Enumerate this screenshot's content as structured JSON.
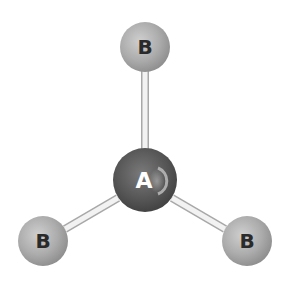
{
  "diagram": {
    "type": "molecular-geometry",
    "shape": "trigonal-planar",
    "central_atom": {
      "label": "A",
      "x": 145,
      "y": 180,
      "r": 32
    },
    "outer_atoms": [
      {
        "label": "B",
        "x": 145,
        "y": 47,
        "r": 25
      },
      {
        "label": "B",
        "x": 43,
        "y": 241,
        "r": 25
      },
      {
        "label": "B",
        "x": 247,
        "y": 241,
        "r": 25
      }
    ],
    "colors": {
      "central_atom": "#5a5a5a",
      "outer_atom": "#a8a8a8",
      "bond_fill": "#f0f0f0",
      "bond_stroke": "#b0b0b0",
      "central_label": "#ffffff",
      "outer_label": "#2a2a2a"
    }
  }
}
